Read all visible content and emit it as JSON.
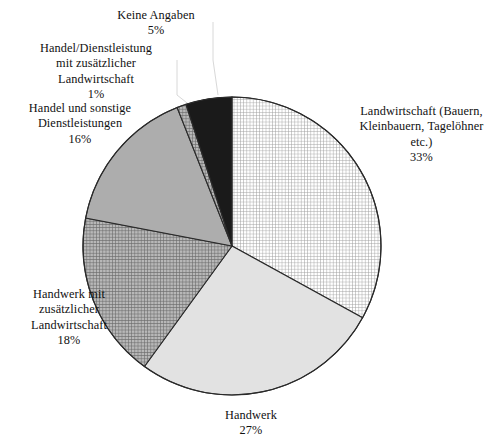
{
  "chart_data": {
    "type": "pie",
    "title": "",
    "subtitle": "",
    "xlabel": "",
    "ylabel": "",
    "legend_position": "labels-outside",
    "grid": false,
    "units": "percent",
    "start_angle_deg": 0,
    "direction": "clockwise",
    "categories": [
      "Landwirtschaft (Bauern, Kleinbauern, Tagelöhner etc.)",
      "Handwerk",
      "Handwerk mit zusätzlicher Landwirtschaft",
      "Handel und sonstige Dienstleistungen",
      "Handel/Dienstleistung mit zusätzlicher Landwirtschaft",
      "Keine Angaben"
    ],
    "values": [
      33,
      27,
      18,
      16,
      1,
      5
    ],
    "slices": [
      {
        "id": "landwirtschaft",
        "label": "Landwirtschaft (Bauern,\nKleinbauern, Tagelöhner\netc.)",
        "value_text": "33%",
        "value": 33,
        "fill": "grid-hatch-light",
        "fill_color": "#ffffff",
        "hatch_color": "#9a9a9a"
      },
      {
        "id": "handwerk",
        "label": "Handwerk",
        "value_text": "27%",
        "value": 27,
        "fill": "solid",
        "fill_color": "#e2e2e2",
        "hatch_color": ""
      },
      {
        "id": "handwerk-zusaetzlich",
        "label": "Handwerk mit\nzusätzlicher\nLandwirtschaft",
        "value_text": "18%",
        "value": 18,
        "fill": "grid-hatch-dark",
        "fill_color": "#b4b4b4",
        "hatch_color": "#6e6e6e"
      },
      {
        "id": "handel-sonstige",
        "label": "Handel und sonstige\nDienstleistungen",
        "value_text": "16%",
        "value": 16,
        "fill": "solid",
        "fill_color": "#adadad",
        "hatch_color": ""
      },
      {
        "id": "handel-zusaetzlich",
        "label": "Handel/Dienstleistung\nmit zusätzlicher\nLandwirtschaft",
        "value_text": "1%",
        "value": 1,
        "fill": "grid-hatch-dark",
        "fill_color": "#b4b4b4",
        "hatch_color": "#6e6e6e"
      },
      {
        "id": "keine-angaben",
        "label": "Keine Angaben",
        "value_text": "5%",
        "value": 5,
        "fill": "solid",
        "fill_color": "#1a1a1a",
        "hatch_color": ""
      }
    ],
    "geometry": {
      "center_x": 232,
      "center_y": 246,
      "radius": 149,
      "outline_color": "#2a2a2a"
    }
  }
}
